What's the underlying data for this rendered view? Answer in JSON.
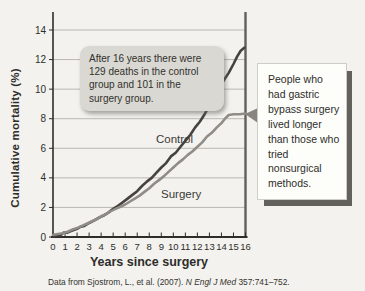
{
  "chart_data": {
    "type": "line",
    "title": "",
    "xlabel": "Years since surgery",
    "ylabel": "Cumulative mortality (%)",
    "xlim": [
      0,
      16
    ],
    "ylim": [
      0,
      14
    ],
    "x_ticks": [
      0,
      1,
      2,
      3,
      4,
      5,
      6,
      7,
      8,
      9,
      10,
      11,
      12,
      13,
      14,
      15,
      16
    ],
    "y_ticks": [
      0,
      2,
      4,
      6,
      8,
      10,
      12,
      14
    ],
    "grid": "horizontal",
    "legend_position": "inline-labels",
    "series": [
      {
        "name": "Control",
        "color": "#45433f",
        "final_value_pct": 12.8,
        "points": [
          [
            0,
            0.05
          ],
          [
            0.3,
            0.1
          ],
          [
            0.6,
            0.1
          ],
          [
            0.9,
            0.3
          ],
          [
            1.2,
            0.3
          ],
          [
            1.5,
            0.4
          ],
          [
            2,
            0.55
          ],
          [
            2.3,
            0.7
          ],
          [
            2.6,
            0.75
          ],
          [
            3,
            0.95
          ],
          [
            3.4,
            1.1
          ],
          [
            3.8,
            1.3
          ],
          [
            4.2,
            1.45
          ],
          [
            4.6,
            1.65
          ],
          [
            5,
            1.9
          ],
          [
            5.4,
            2.1
          ],
          [
            5.8,
            2.35
          ],
          [
            6.2,
            2.6
          ],
          [
            6.6,
            2.85
          ],
          [
            7,
            3.1
          ],
          [
            7.4,
            3.45
          ],
          [
            7.8,
            3.75
          ],
          [
            8.2,
            4.0
          ],
          [
            8.6,
            4.35
          ],
          [
            9,
            4.7
          ],
          [
            9.4,
            5.0
          ],
          [
            9.8,
            5.45
          ],
          [
            10.2,
            5.7
          ],
          [
            10.6,
            6.1
          ],
          [
            11,
            6.5
          ],
          [
            11.4,
            6.9
          ],
          [
            11.8,
            7.4
          ],
          [
            12.2,
            7.8
          ],
          [
            12.6,
            8.3
          ],
          [
            13,
            8.9
          ],
          [
            13.4,
            9.5
          ],
          [
            13.8,
            10.1
          ],
          [
            14.2,
            10.6
          ],
          [
            14.6,
            11.1
          ],
          [
            15,
            11.7
          ],
          [
            15.3,
            12.2
          ],
          [
            15.6,
            12.6
          ],
          [
            15.9,
            12.8
          ]
        ]
      },
      {
        "name": "Surgery",
        "color": "#8f8d86",
        "final_value_pct": 8.3,
        "points": [
          [
            0,
            0.15
          ],
          [
            0.4,
            0.2
          ],
          [
            0.8,
            0.25
          ],
          [
            1.2,
            0.35
          ],
          [
            1.6,
            0.5
          ],
          [
            2,
            0.6
          ],
          [
            2.4,
            0.75
          ],
          [
            2.8,
            0.9
          ],
          [
            3.2,
            1.05
          ],
          [
            3.6,
            1.2
          ],
          [
            4,
            1.4
          ],
          [
            4.4,
            1.55
          ],
          [
            4.8,
            1.75
          ],
          [
            5.2,
            1.9
          ],
          [
            5.6,
            2.05
          ],
          [
            6,
            2.2
          ],
          [
            6.4,
            2.4
          ],
          [
            6.8,
            2.6
          ],
          [
            7.2,
            2.8
          ],
          [
            7.6,
            3.05
          ],
          [
            8,
            3.3
          ],
          [
            8.4,
            3.6
          ],
          [
            8.8,
            3.85
          ],
          [
            9.2,
            4.1
          ],
          [
            9.6,
            4.4
          ],
          [
            10,
            4.7
          ],
          [
            10.4,
            5.0
          ],
          [
            10.8,
            5.25
          ],
          [
            11.2,
            5.55
          ],
          [
            11.6,
            5.8
          ],
          [
            12,
            6.1
          ],
          [
            12.4,
            6.4
          ],
          [
            12.8,
            6.8
          ],
          [
            13.2,
            7.05
          ],
          [
            13.6,
            7.4
          ],
          [
            14,
            7.7
          ],
          [
            14.3,
            8.0
          ],
          [
            14.6,
            8.25
          ],
          [
            15,
            8.3
          ],
          [
            15.5,
            8.3
          ],
          [
            16,
            8.35
          ]
        ]
      }
    ]
  },
  "annotation": {
    "text": "After 16 years there were 129 deaths in the control group and 101 in the surgery group."
  },
  "callout": {
    "text": "People who had gastric bypass surgery lived longer than those who tried nonsurgical methods."
  },
  "source": {
    "prefix": "Data from Sjostrom, L., et al. (2007). ",
    "journal": "N Engl J Med",
    "suffix": " 357:741–752."
  },
  "colors": {
    "page_bg": "#f3f2ee",
    "gridline": "#bab8b2",
    "axis": "#2e2d2a",
    "right_spine": "#615f5a",
    "control_line": "#45433f",
    "surgery_line": "#8f8d86",
    "annotation_bg": "#d9d8d2",
    "callout_bg": "#fdfdfa",
    "callout_shadow": "#63615b"
  }
}
